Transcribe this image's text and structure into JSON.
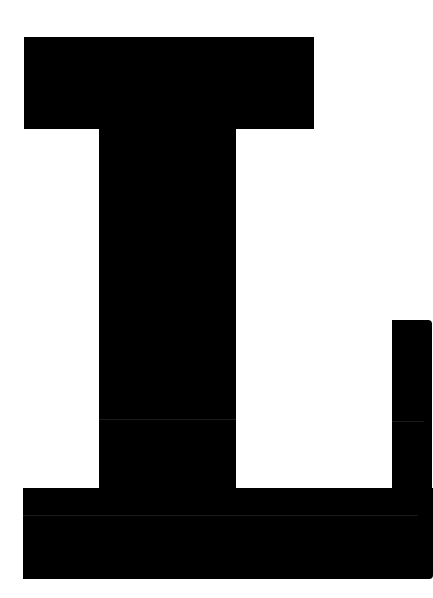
{
  "glyph": {
    "character": "L",
    "fill_color": "#000000",
    "background_color": "#ffffff"
  }
}
